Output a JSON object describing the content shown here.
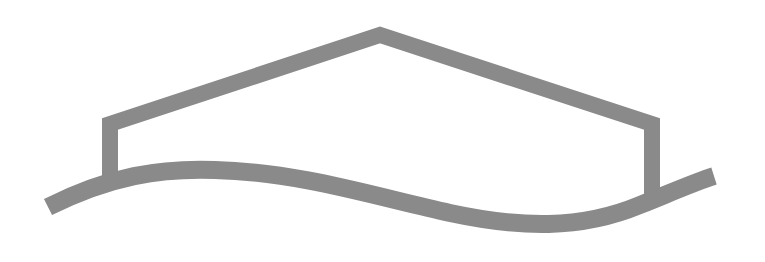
{
  "logo": {
    "name": "house-over-wave-logo",
    "stroke_color": "#8a8a8a",
    "background_color": "#ffffff",
    "elements": [
      "house-roof-outline",
      "left-wall",
      "right-wall",
      "wave-ground-line"
    ]
  }
}
